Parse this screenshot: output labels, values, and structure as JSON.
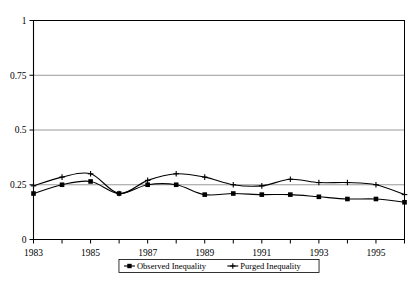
{
  "chart_data": {
    "type": "line",
    "title": "",
    "subtitle": "",
    "xlabel": "",
    "ylabel": "",
    "x": [
      1983,
      1984,
      1985,
      1986,
      1987,
      1988,
      1989,
      1990,
      1991,
      1992,
      1993,
      1994,
      1995,
      1996
    ],
    "xlim": [
      1983,
      1996
    ],
    "ylim": [
      0,
      1
    ],
    "yticks": [
      0,
      0.25,
      0.5,
      0.75,
      1
    ],
    "ytick_labels": [
      "0",
      "0.25",
      "0.5",
      "0.75",
      "1"
    ],
    "xticks": [
      1983,
      1985,
      1987,
      1989,
      1991,
      1993,
      1995
    ],
    "xtick_labels": [
      "1983",
      "1985",
      "1987",
      "1989",
      "1991",
      "1993",
      "1995"
    ],
    "grid": true,
    "grid_axis": "y",
    "legend_position": "bottom",
    "smoothing": "spline",
    "series": [
      {
        "name": "Observed Inequality",
        "marker": "square",
        "color": "#000000",
        "values": [
          0.21,
          0.25,
          0.265,
          0.21,
          0.25,
          0.25,
          0.205,
          0.21,
          0.205,
          0.205,
          0.195,
          0.185,
          0.185,
          0.17
        ]
      },
      {
        "name": "Purged Inequality",
        "marker": "plus",
        "color": "#000000",
        "values": [
          0.245,
          0.285,
          0.3,
          0.21,
          0.27,
          0.3,
          0.285,
          0.25,
          0.245,
          0.275,
          0.26,
          0.26,
          0.25,
          0.205
        ]
      }
    ]
  },
  "legend": {
    "items": [
      {
        "label": "Observed Inequality",
        "marker": "square"
      },
      {
        "label": "Purged Inequality",
        "marker": "plus"
      }
    ]
  }
}
